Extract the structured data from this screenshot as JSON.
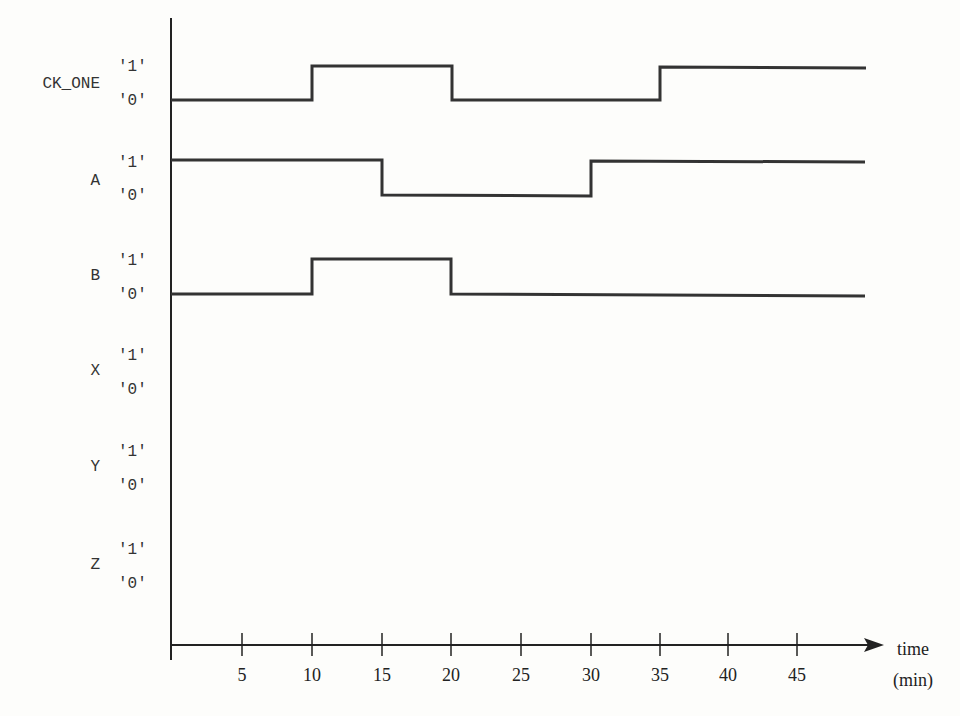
{
  "diagram": {
    "type": "timing-diagram",
    "signals": [
      {
        "name": "CK_ONE",
        "high_label": "'1'",
        "low_label": "'0'",
        "initial": 0,
        "transitions": [
          10,
          20,
          35
        ]
      },
      {
        "name": "A",
        "high_label": "'1'",
        "low_label": "'0'",
        "initial": 1,
        "transitions": [
          15,
          30
        ]
      },
      {
        "name": "B",
        "high_label": "'1'",
        "low_label": "'0'",
        "initial": 0,
        "transitions": [
          10,
          20
        ]
      },
      {
        "name": "X",
        "high_label": "'1'",
        "low_label": "'0'",
        "initial": null,
        "transitions": []
      },
      {
        "name": "Y",
        "high_label": "'1'",
        "low_label": "'0'",
        "initial": null,
        "transitions": []
      },
      {
        "name": "Z",
        "high_label": "'1'",
        "low_label": "'0'",
        "initial": null,
        "transitions": []
      }
    ],
    "time_axis": {
      "label": "time",
      "unit": "(min)",
      "ticks": [
        "5",
        "10",
        "15",
        "20",
        "25",
        "30",
        "35",
        "40",
        "45"
      ],
      "end": 50
    }
  },
  "labels": {
    "sig0": "CK_ONE",
    "sig1": "A",
    "sig2": "B",
    "sig3": "X",
    "sig4": "Y",
    "sig5": "Z",
    "one": "'1'",
    "zero": "'0'",
    "axis_label": "time",
    "axis_unit": "(min)",
    "t5": "5",
    "t10": "10",
    "t15": "15",
    "t20": "20",
    "t25": "25",
    "t30": "30",
    "t35": "35",
    "t40": "40",
    "t45": "45"
  }
}
